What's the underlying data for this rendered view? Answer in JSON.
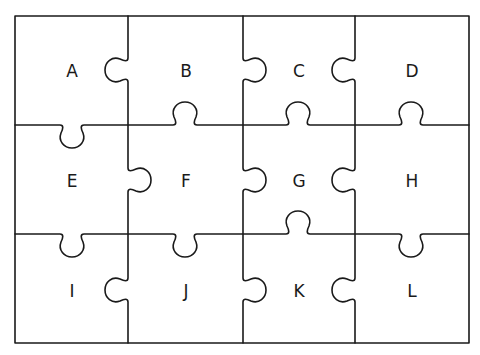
{
  "diagram": {
    "type": "jigsaw-puzzle-grid",
    "rows": 3,
    "cols": 4,
    "stroke_color": "#1a1a1a",
    "background": "#ffffff",
    "pieces": [
      {
        "label": "A",
        "row": 0,
        "col": 0
      },
      {
        "label": "B",
        "row": 0,
        "col": 1
      },
      {
        "label": "C",
        "row": 0,
        "col": 2
      },
      {
        "label": "D",
        "row": 0,
        "col": 3
      },
      {
        "label": "E",
        "row": 1,
        "col": 0
      },
      {
        "label": "F",
        "row": 1,
        "col": 1
      },
      {
        "label": "G",
        "row": 1,
        "col": 2
      },
      {
        "label": "H",
        "row": 1,
        "col": 3
      },
      {
        "label": "I",
        "row": 2,
        "col": 0
      },
      {
        "label": "J",
        "row": 2,
        "col": 1
      },
      {
        "label": "K",
        "row": 2,
        "col": 2
      },
      {
        "label": "L",
        "row": 2,
        "col": 3
      }
    ]
  }
}
